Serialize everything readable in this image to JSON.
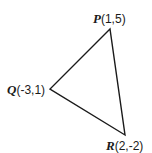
{
  "diagram": {
    "type": "triangle",
    "stroke_color": "#1a1a1a",
    "vertices": [
      {
        "name": "P",
        "coords": "(1,5)",
        "px": [
          110,
          29
        ]
      },
      {
        "name": "Q",
        "coords": "(-3,1)",
        "px": [
          50,
          89
        ]
      },
      {
        "name": "R",
        "coords": "(2,-2)",
        "px": [
          125,
          135
        ]
      }
    ]
  }
}
